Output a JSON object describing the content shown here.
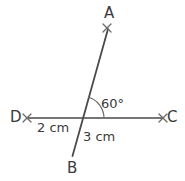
{
  "diagram": {
    "type": "geometry-line-diagram",
    "background_color": "#ffffff",
    "stroke_color": "#4a4a4a",
    "text_color": "#3a3a3a",
    "points": {
      "A": {
        "label": "A",
        "x": 107,
        "y": 28,
        "marker": "x"
      },
      "B": {
        "label": "B",
        "x": 73,
        "y": 155,
        "marker": "none"
      },
      "C": {
        "label": "C",
        "x": 163,
        "y": 118,
        "marker": "x"
      },
      "D": {
        "label": "D",
        "x": 27,
        "y": 118,
        "marker": "x"
      },
      "intersection": {
        "label": "",
        "x": 82,
        "y": 118,
        "marker": "none"
      }
    },
    "lines": [
      {
        "name": "line-AB",
        "from": "A",
        "to": "B"
      },
      {
        "name": "line-DC",
        "from": "D",
        "to": "C"
      }
    ],
    "angle": {
      "name": "angle-AXC",
      "value": "60°",
      "between": [
        "A",
        "C"
      ],
      "vertex": "intersection",
      "arc_radius": 22
    },
    "measurements": [
      {
        "name": "segment-DX",
        "value": "2 cm",
        "segment": [
          "D",
          "intersection"
        ]
      },
      {
        "name": "segment-XB",
        "value": "3 cm",
        "segment": [
          "intersection",
          "B"
        ]
      }
    ]
  }
}
